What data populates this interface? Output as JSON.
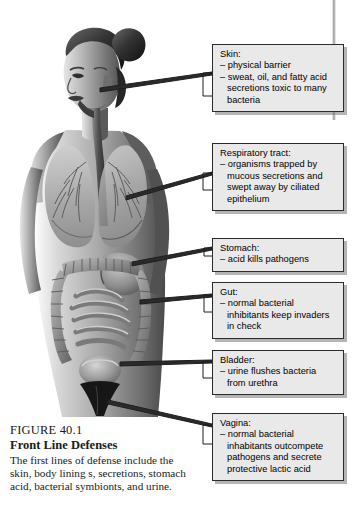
{
  "figure": {
    "number": "FIGURE 40.1",
    "title": "Front Line Defenses",
    "caption": "The first lines of defense include the skin, body lining s, secretions, stomach acid, bacterial symbionts, and urine."
  },
  "illustration": {
    "alt_name": "female-body-anatomy-grayscale",
    "organs": [
      "head",
      "hair-bun",
      "face",
      "neck",
      "trachea",
      "esophagus",
      "lungs",
      "bronchial-tree",
      "breasts",
      "stomach",
      "large-intestine",
      "small-intestine",
      "bladder",
      "pelvis"
    ]
  },
  "callouts": [
    {
      "id": "skin",
      "heading": "Skin:",
      "items": [
        "physical barrier",
        "sweat, oil, and fatty acid secretions toxic to many bacteria"
      ]
    },
    {
      "id": "respiratory",
      "heading": "Respiratory tract:",
      "items": [
        "organisms trapped by mucous secretions and swept away by ciliated epithelium"
      ]
    },
    {
      "id": "stomach",
      "heading": "Stomach:",
      "items": [
        "acid kills pathogens"
      ]
    },
    {
      "id": "gut",
      "heading": "Gut:",
      "items": [
        "normal bacterial inhibitants keep invaders in check"
      ]
    },
    {
      "id": "bladder",
      "heading": "Bladder:",
      "items": [
        "urine flushes bacteria from urethra"
      ]
    },
    {
      "id": "vagina",
      "heading": "Vagina:",
      "items": [
        "normal bacterial inhabitants outcompete pathogens and secrete protective lactic acid"
      ]
    }
  ],
  "colors": {
    "box_fill": "#e9e9e9",
    "box_border": "#2b2b2b",
    "box_shadow": "#8a8a8a",
    "text": "#000000",
    "page_background": "#ffffff",
    "illustration_dark": "#3a3a3a",
    "illustration_mid": "#7d7d7d",
    "illustration_light": "#c8c8c8"
  }
}
